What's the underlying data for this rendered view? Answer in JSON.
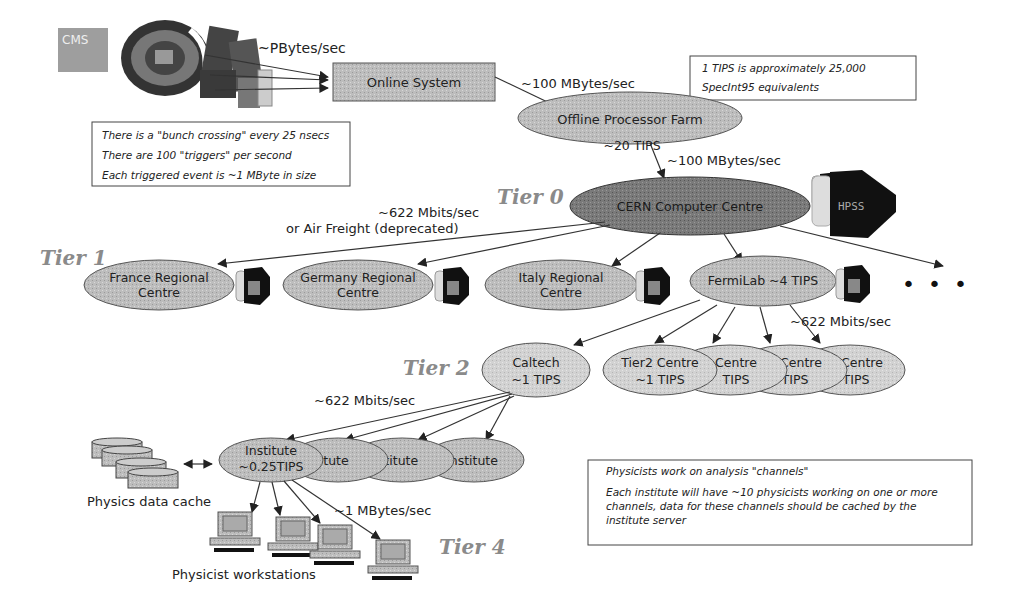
{
  "diagram": {
    "detector_label": "CMS",
    "nodes": {
      "online_system": "Online System",
      "offline_farm": "Offline Processor Farm",
      "offline_farm_sub": "~20 TIPS",
      "cern": "CERN Computer Centre",
      "france": [
        "France Regional",
        "Centre"
      ],
      "germany": [
        "Germany Regional",
        "Centre"
      ],
      "italy": [
        "Italy Regional",
        "Centre"
      ],
      "fermilab": "FermiLab ~4 TIPS",
      "caltech": [
        "Caltech",
        "~1 TIPS"
      ],
      "tier2_centre": [
        "Tier2 Centre",
        "~1 TIPS"
      ],
      "tier2_centre_b": [
        "Centre",
        "TIPS"
      ],
      "tier2_centre_c": [
        "2 Centre",
        "TIPS"
      ],
      "tier2_centre_d": [
        "2 Centre",
        "TIPS"
      ],
      "institute_main": [
        "Institute",
        "~0.25TIPS"
      ],
      "institute_b": "tute",
      "institute_c": "stitute",
      "institute_d": "Institute",
      "data_cache": "Physics data cache",
      "workstations": "Physicist workstations",
      "ellipsis": "• • •"
    },
    "links": {
      "detector_to_online": "~PBytes/sec",
      "online_to_offline": "~100 MBytes/sec",
      "offline_to_cern": "~100 MBytes/sec",
      "cern_to_tier1_a": "~622 Mbits/sec",
      "cern_to_tier1_b": "or Air Freight (deprecated)",
      "fermilab_to_tier2": "~622 Mbits/sec",
      "caltech_to_institutes": "~622 Mbits/sec",
      "institute_to_workstations": "~1 MBytes/sec"
    },
    "tiers": {
      "tier0": "Tier 0",
      "tier1": "Tier 1",
      "tier2": "Tier 2",
      "tier4": "Tier 4"
    },
    "notes": {
      "trigger_box": [
        "There is a \"bunch crossing\" every 25 nsecs",
        "There are 100 \"triggers\" per second",
        "Each triggered event is ~1 MByte in size"
      ],
      "tips_box": [
        "1 TIPS is approximately 25,000",
        "SpecInt95 equivalents"
      ],
      "physicists_box": [
        "Physicists work on analysis \"channels\"",
        "Each institute will have ~10 physicists working on one or more",
        "channels, data for these channels should be cached by the",
        "institute server"
      ]
    },
    "colors": {
      "node_fill": "#bdbdbd",
      "cern_fill": "#7a7a7a",
      "tier2_fill": "#d2d2d2",
      "tier_label": "#8a8a8a",
      "edge": "#333333"
    }
  }
}
